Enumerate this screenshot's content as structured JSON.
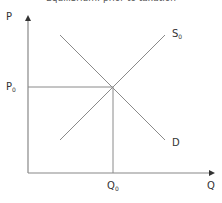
{
  "diagram": {
    "title": "Equilibrium: prior to taxation",
    "axes": {
      "y_label": "P",
      "x_label": "Q"
    },
    "curves": [
      {
        "name": "supply",
        "label": "S",
        "subscript": "0",
        "from": [
          60,
          140
        ],
        "to": [
          165,
          35
        ]
      },
      {
        "name": "demand",
        "label": "D",
        "subscript": "",
        "from": [
          60,
          35
        ],
        "to": [
          165,
          140
        ]
      }
    ],
    "equilibrium": {
      "price_label": "P",
      "price_subscript": "0",
      "quantity_label": "Q",
      "quantity_subscript": "0",
      "point": [
        113,
        87
      ]
    },
    "colors": {
      "axis": "#666666",
      "curve": "#888888",
      "text": "#333333"
    }
  }
}
